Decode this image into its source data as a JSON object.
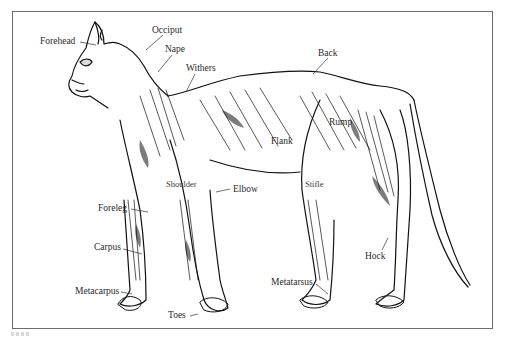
{
  "figure": {
    "type": "anatomical line illustration",
    "line_color": "#111111",
    "frame_color": "#6b6b6b",
    "background": "#ffffff"
  },
  "labels": {
    "forehead": "Forehead",
    "occiput": "Occiput",
    "nape": "Nape",
    "withers": "Withers",
    "back": "Back",
    "rump": "Rump",
    "flank": "Flank",
    "shoulder": "Shoulder",
    "elbow": "Elbow",
    "stifle": "Stifle",
    "foreleg": "Foreleg",
    "carpus": "Carpus",
    "metacarpus": "Metacarpus",
    "toes": "Toes",
    "metatarsus": "Metatarsus",
    "hock": "Hock"
  }
}
